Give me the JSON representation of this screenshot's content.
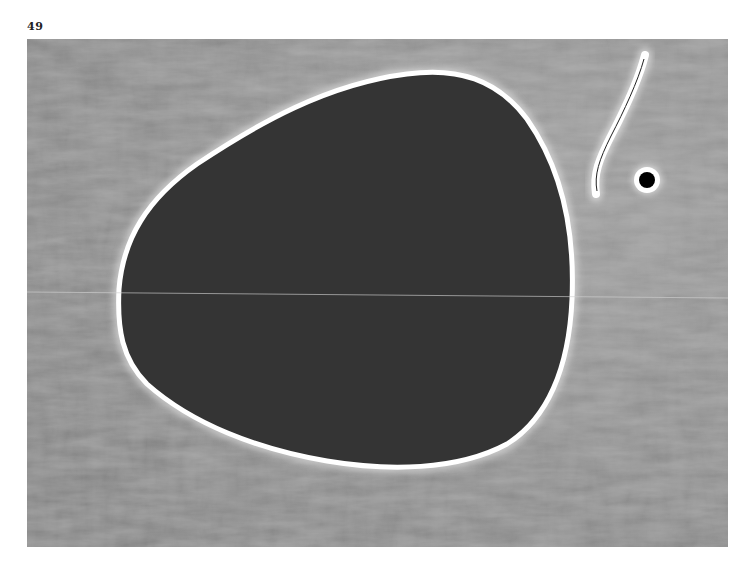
{
  "page": {
    "number": "49"
  },
  "artwork": {
    "description": "Grayscale reproduction of an abstract painting: large dark egg-shaped form with white halo outline on a mottled gray ground, a thin white curved stroke with dark center line and a small black dot with white halo at upper right",
    "colors": {
      "background": "#8a8a8a",
      "background_light": "#9c9c9c",
      "form_fill": "#343434",
      "outline": "#ffffff",
      "dot": "#000000"
    }
  }
}
